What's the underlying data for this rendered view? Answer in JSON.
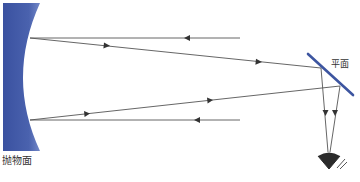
{
  "labels": {
    "parabolic_mirror": "抛物面",
    "plane_mirror": "平面"
  },
  "colors": {
    "mirror_blue": "#3d55a0",
    "mirror_highlight": "#6e83c4",
    "ray": "#555555",
    "eye": "#2b2b2b"
  },
  "elements": {
    "parabolic_mirror": {
      "type": "concave-parabolic-mirror",
      "position": "left"
    },
    "plane_mirror": {
      "type": "flat-diagonal-mirror",
      "position": "right"
    },
    "eye": {
      "type": "observer-eye",
      "position": "bottom-right"
    },
    "rays": [
      {
        "id": "incoming-top",
        "direction": "right-to-left",
        "from": [
          240,
          38
        ],
        "to": [
          30,
          38
        ]
      },
      {
        "id": "reflected-top",
        "direction": "left-to-right",
        "from": [
          30,
          38
        ],
        "to": [
          321,
          68
        ]
      },
      {
        "id": "incoming-bottom",
        "direction": "right-to-left",
        "from": [
          240,
          120
        ],
        "to": [
          30,
          120
        ]
      },
      {
        "id": "reflected-bottom",
        "direction": "left-to-right",
        "from": [
          30,
          120
        ],
        "to": [
          340,
          86
        ]
      },
      {
        "id": "to-eye-left",
        "direction": "down",
        "from": [
          321,
          68
        ],
        "to": [
          327,
          152
        ]
      },
      {
        "id": "to-eye-right",
        "direction": "down",
        "from": [
          340,
          86
        ],
        "to": [
          331,
          152
        ]
      }
    ]
  }
}
